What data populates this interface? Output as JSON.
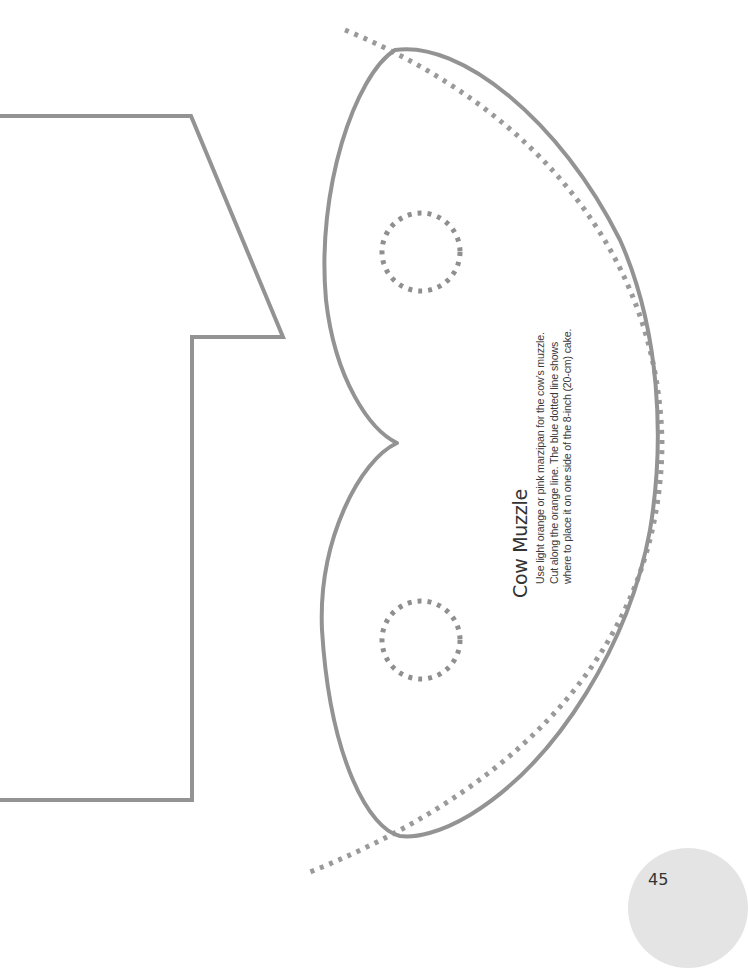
{
  "page": {
    "number": "45"
  },
  "template": {
    "title": "Cow Muzzle",
    "instructions": [
      "Use light orange or pink marzipan for the cow’s muzzle.",
      "Cut along the orange line. The blue dotted line shows",
      "where to place it on one side of the 8-inch (20-cm) cake."
    ]
  },
  "colors": {
    "outline": "#939393",
    "dotted": "#999999",
    "page_badge": "#e4e4e4",
    "text": "#3a3a3a"
  },
  "shapes": [
    {
      "name": "cow-head-outline",
      "style": "solid"
    },
    {
      "name": "muzzle-outline",
      "style": "solid"
    },
    {
      "name": "cake-edge-guide",
      "style": "dotted"
    },
    {
      "name": "nostril-guide-top",
      "style": "dotted"
    },
    {
      "name": "nostril-guide-bottom",
      "style": "dotted"
    }
  ]
}
